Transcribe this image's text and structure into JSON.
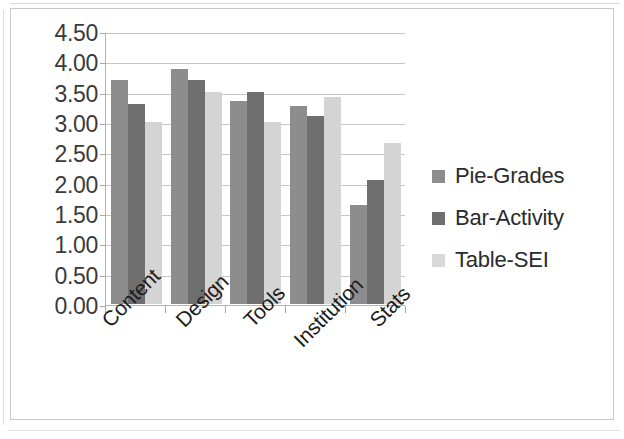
{
  "chart_data": {
    "type": "bar",
    "title": "",
    "subtitle": "",
    "xlabel": "",
    "ylabel": "",
    "categories": [
      "Content",
      "Design",
      "Tools",
      "Institution",
      "Stats"
    ],
    "series": [
      {
        "name": "Pie-Grades",
        "color": "#8d8d8d",
        "values": [
          3.7,
          3.88,
          3.35,
          3.27,
          1.63
        ]
      },
      {
        "name": "Bar-Activity",
        "color": "#6f6f6f",
        "values": [
          3.3,
          3.7,
          3.5,
          3.1,
          2.05
        ]
      },
      {
        "name": "Table-SEI",
        "color": "#d4d4d4",
        "values": [
          3.0,
          3.5,
          3.0,
          3.42,
          2.65
        ]
      }
    ],
    "ylim": [
      0.0,
      4.5
    ],
    "ytick_step": 0.5,
    "ytick_labels": [
      "4.50",
      "4.00",
      "3.50",
      "3.00",
      "2.50",
      "2.00",
      "1.50",
      "1.00",
      "0.50",
      "0.00"
    ],
    "grid": true,
    "grid_axis": "y",
    "legend_position": "right",
    "xlabel_rotation": -45,
    "grouped": true,
    "annotations": []
  },
  "legend": {
    "items": [
      {
        "label": "Pie-Grades"
      },
      {
        "label": "Bar-Activity"
      },
      {
        "label": "Table-SEI"
      }
    ]
  }
}
